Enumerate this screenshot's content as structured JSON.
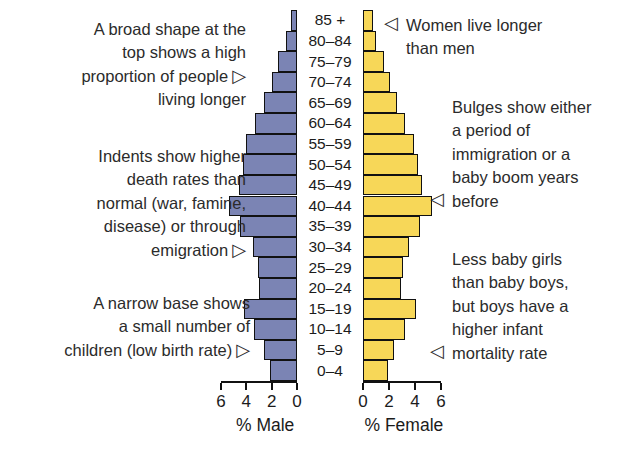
{
  "chart_data": {
    "type": "bar",
    "title": "",
    "subtitle": "",
    "orientation": "horizontal-pyramid",
    "categories": [
      "0–4",
      "5–9",
      "10–14",
      "15–19",
      "20–24",
      "25–29",
      "30–34",
      "35–39",
      "40–44",
      "45–49",
      "50–54",
      "55–59",
      "60–64",
      "65–69",
      "70–74",
      "75–79",
      "80–84",
      "85 +"
    ],
    "series": [
      {
        "name": "% Male",
        "color": "#7b84b4",
        "direction": "left",
        "values": [
          2.1,
          2.6,
          3.4,
          4.2,
          3.0,
          3.1,
          3.5,
          4.5,
          5.4,
          4.6,
          4.3,
          4.0,
          3.3,
          2.6,
          2.0,
          1.5,
          0.9,
          0.5
        ]
      },
      {
        "name": "% Female",
        "color": "#f7d758",
        "direction": "right",
        "values": [
          1.9,
          2.4,
          3.2,
          4.1,
          2.9,
          3.1,
          3.5,
          4.4,
          5.3,
          4.5,
          4.2,
          3.9,
          3.2,
          2.6,
          2.1,
          1.6,
          1.0,
          0.8
        ]
      }
    ],
    "xlabel_left": "% Male",
    "xlabel_right": "% Female",
    "ylabel": "Age group",
    "xlim": [
      0,
      6
    ],
    "xticks_left": [
      "6",
      "4",
      "2",
      "0"
    ],
    "xticks_right": [
      "0",
      "2",
      "4",
      "6"
    ],
    "grid": false,
    "legend": "none"
  },
  "annotations": {
    "left": [
      {
        "id": "broad-top",
        "lines": [
          "A broad shape at the",
          "top shows a high",
          "proportion of people",
          "living longer"
        ],
        "pointer": "▷",
        "pointer_on_line": 2
      },
      {
        "id": "indents",
        "lines": [
          "Indents show higher",
          "death rates than",
          "normal (war, famine,",
          "disease) or through",
          "emigration"
        ],
        "pointer": "▷",
        "pointer_on_line": 4
      },
      {
        "id": "narrow-base",
        "lines": [
          "A narrow base shows",
          "a small number of",
          "children (low birth rate)"
        ],
        "pointer": "▷",
        "pointer_on_line": 2
      }
    ],
    "right": [
      {
        "id": "women-live-longer",
        "lines": [
          "Women live longer",
          "than men"
        ],
        "pointer": "◁",
        "pointer_on_line": 0
      },
      {
        "id": "bulges",
        "lines": [
          "Bulges show either",
          "a period of",
          "immigration or a",
          "baby boom years",
          "before"
        ],
        "pointer": "◁",
        "pointer_on_line": 4
      },
      {
        "id": "baby-girls",
        "lines": [
          "Less baby girls",
          "than baby boys,",
          "but boys have a",
          "higher infant",
          "mortality rate"
        ],
        "pointer": "◁",
        "pointer_on_line": 4
      }
    ]
  },
  "colors": {
    "male": "#7b84b4",
    "female": "#f7d758",
    "outline": "#111111",
    "text": "#2b2b2b",
    "background": "#ffffff"
  }
}
